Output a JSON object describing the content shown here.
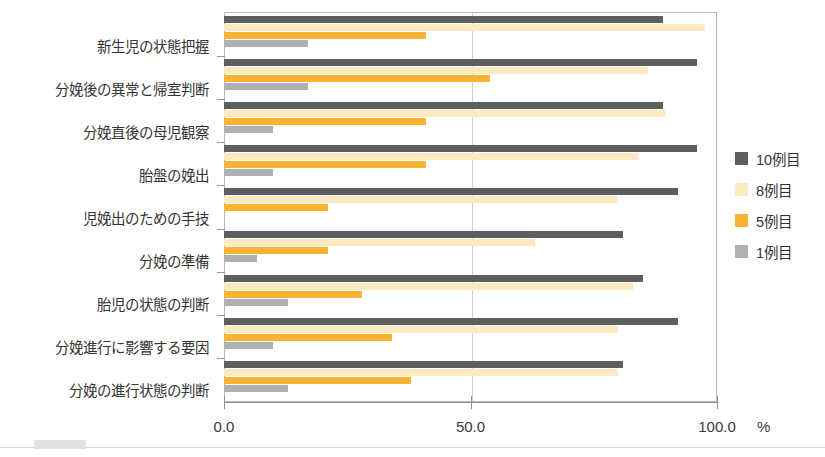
{
  "chart_data": {
    "type": "bar",
    "orientation": "horizontal",
    "title": "",
    "xlabel": "%",
    "ylabel": "",
    "xlim": [
      0,
      100
    ],
    "xticks": [
      "0.0",
      "50.0",
      "100.0"
    ],
    "xtick_values": [
      0,
      50,
      100
    ],
    "grid": "vertical-at-50",
    "legend_position": "right",
    "categories": [
      "新生児の状態把握",
      "分娩後の異常と帰室判断",
      "分娩直後の母児観察",
      "胎盤の娩出",
      "児娩出のための手技",
      "分娩の準備",
      "胎児の状態の判断",
      "分娩進行に影響する要因",
      "分娩の進行状態の判断"
    ],
    "series": [
      {
        "name": "10例目",
        "color": "#5e5e5e",
        "values": [
          89.0,
          96.0,
          89.0,
          96.0,
          92.0,
          81.0,
          85.0,
          92.0,
          81.0
        ]
      },
      {
        "name": "8例目",
        "color": "#fbe9c0",
        "values": [
          97.5,
          86.0,
          89.5,
          84.0,
          80.0,
          63.0,
          83.0,
          80.0,
          80.0
        ]
      },
      {
        "name": "5例目",
        "color": "#f9b233",
        "values": [
          41.0,
          54.0,
          41.0,
          41.0,
          21.0,
          21.0,
          28.0,
          34.0,
          38.0
        ]
      },
      {
        "name": "1例目",
        "color": "#b0b0b0",
        "values": [
          17.0,
          17.0,
          10.0,
          10.0,
          0.0,
          6.7,
          13.0,
          10.0,
          13.0
        ]
      }
    ]
  },
  "axis": {
    "unit_label": "%",
    "tick_labels": [
      "0.0",
      "50.0",
      "100.0"
    ]
  },
  "legend": {
    "items": [
      {
        "label": "10例目",
        "color": "#5e5e5e"
      },
      {
        "label": "8例目",
        "color": "#fbe9c0"
      },
      {
        "label": "5例目",
        "color": "#f9b233"
      },
      {
        "label": "1例目",
        "color": "#b0b0b0"
      }
    ]
  }
}
